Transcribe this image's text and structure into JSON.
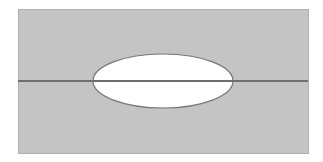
{
  "diagram": {
    "colors": {
      "background": "#ffffff",
      "field_fill": "#c4c4c4",
      "field_border": "#b0b0b0",
      "line": "#6e6e6e",
      "ellipse_fill": "#ffffff",
      "ellipse_stroke": "#777777"
    },
    "rect": {
      "x": 18,
      "y": 9,
      "width": 290,
      "height": 144
    },
    "line": {
      "y": 81,
      "x1": 18,
      "x2": 308,
      "thickness": 2
    },
    "ellipse": {
      "cx": 163,
      "cy": 81,
      "rx": 70,
      "ry": 27
    }
  }
}
